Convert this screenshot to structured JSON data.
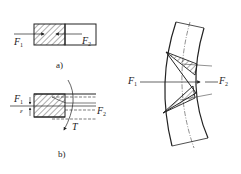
{
  "diagram": {
    "panel_a": {
      "caption": "a)",
      "force_left": {
        "symbol": "F",
        "sub": "1"
      },
      "force_right": {
        "symbol": "F",
        "sub": "2"
      }
    },
    "panel_b": {
      "caption": "b)",
      "force_left": {
        "symbol": "F",
        "sub": "1"
      },
      "force_right": {
        "symbol": "F",
        "sub": "2"
      },
      "offset_symbol": "ε",
      "torque_symbol": "T"
    },
    "panel_c": {
      "force_left": {
        "symbol": "F",
        "sub": "1"
      },
      "force_right": {
        "symbol": "F",
        "sub": "2"
      }
    },
    "colors": {
      "ink": "#222222",
      "background": "#ffffff"
    }
  }
}
